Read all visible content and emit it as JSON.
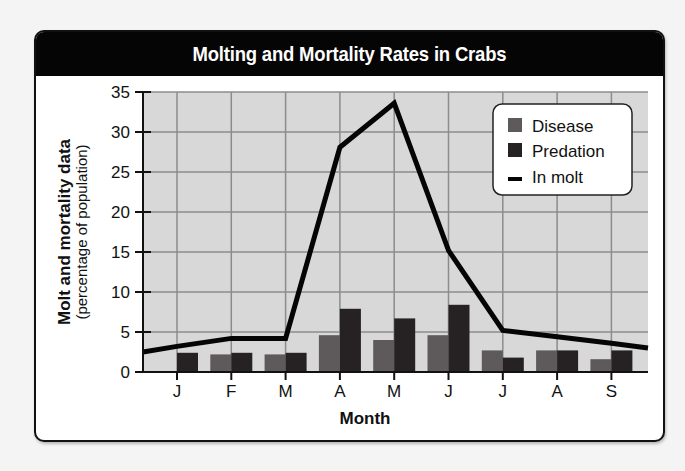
{
  "chart_data": {
    "type": "bar",
    "title": "Molting and Mortality Rates in Crabs",
    "xlabel": "Month",
    "ylabel": "Molt and mortality data",
    "ylabel_sub": "(percentage of population)",
    "categories": [
      "J",
      "F",
      "M",
      "A",
      "M",
      "J",
      "J",
      "A",
      "S"
    ],
    "yticks": [
      0,
      5,
      10,
      15,
      20,
      25,
      30,
      35
    ],
    "ylim": [
      0,
      35
    ],
    "grid": true,
    "legend_position": "upper-right",
    "series": [
      {
        "name": "Disease",
        "kind": "bar",
        "color": "#5e5a5c",
        "values": [
          0,
          2.2,
          2.2,
          4.6,
          4.0,
          4.6,
          2.7,
          2.7,
          1.6
        ]
      },
      {
        "name": "Predation",
        "kind": "bar",
        "color": "#262224",
        "values": [
          2.4,
          2.4,
          2.4,
          7.9,
          6.7,
          8.4,
          1.8,
          2.7,
          2.7
        ]
      },
      {
        "name": "In molt",
        "kind": "line",
        "color": "#050505",
        "values": [
          3.2,
          4.2,
          4.2,
          28.1,
          33.6,
          15.2,
          5.2,
          4.4,
          3.6
        ],
        "start_value": 2.5,
        "end_value": 3.0
      }
    ]
  },
  "legend": {
    "items": [
      {
        "label": "Disease",
        "swatch": "square",
        "color": "#5e5a5c"
      },
      {
        "label": "Predation",
        "swatch": "square",
        "color": "#262224"
      },
      {
        "label": "In molt",
        "swatch": "dash",
        "color": "#050505"
      }
    ]
  },
  "colors": {
    "plot_bg": "#d8d8d8",
    "grid": "#8c8c8c",
    "axis": "#111111",
    "header_bg": "#050505"
  }
}
